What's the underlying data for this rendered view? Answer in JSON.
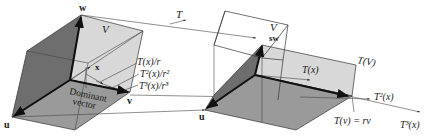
{
  "diagram": {
    "colors": {
      "dark_face": "#6e6e6e",
      "mid_face": "#9a9a9a",
      "light_face": "#d8d8d8",
      "line": "#333333",
      "background": "#ffffff"
    },
    "left_box": {
      "labels": {
        "w": "w",
        "u": "u",
        "v": "v",
        "V": "V",
        "x": "x",
        "dominant_line1": "Dominant",
        "dominant_line2": "vector",
        "Tx_r": "T(x)/r",
        "T2x_r2": "T²(x)/r²",
        "T3x_r3": "T³(x)/r³"
      }
    },
    "transform_arrow": {
      "label": "T"
    },
    "right_box": {
      "labels": {
        "sw": "sw",
        "u": "u",
        "V": "V",
        "TV": "T(V)",
        "Tx": "T(x)",
        "T2x": "T²(x)",
        "T3x": "T³(x)",
        "Tv_eq": "T(v) = rv"
      }
    }
  }
}
